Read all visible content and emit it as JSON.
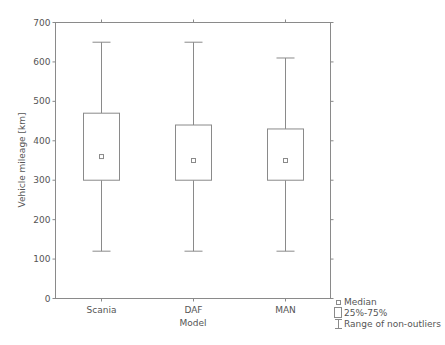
{
  "chart_data": {
    "type": "box",
    "title": "",
    "xlabel": "Model",
    "ylabel": "Vehicle mileage [km]",
    "ylim": [
      0,
      700
    ],
    "yticks": [
      0,
      100,
      200,
      300,
      400,
      500,
      600,
      700
    ],
    "grid": false,
    "categories": [
      "Scania",
      "DAF",
      "MAN"
    ],
    "series": [
      {
        "name": "Scania",
        "median": 360,
        "q1": 300,
        "q3": 470,
        "whisker_low": 120,
        "whisker_high": 650
      },
      {
        "name": "DAF",
        "median": 350,
        "q1": 300,
        "q3": 440,
        "whisker_low": 120,
        "whisker_high": 650
      },
      {
        "name": "MAN",
        "median": 350,
        "q1": 300,
        "q3": 430,
        "whisker_low": 120,
        "whisker_high": 610
      }
    ],
    "legend": {
      "position": "bottom-right-outside",
      "entries": [
        "Median",
        "25%-75%",
        "Range of non-outliers"
      ]
    }
  },
  "colors": {
    "line": "#8a8a8a",
    "text": "#555555",
    "background": "#ffffff"
  }
}
